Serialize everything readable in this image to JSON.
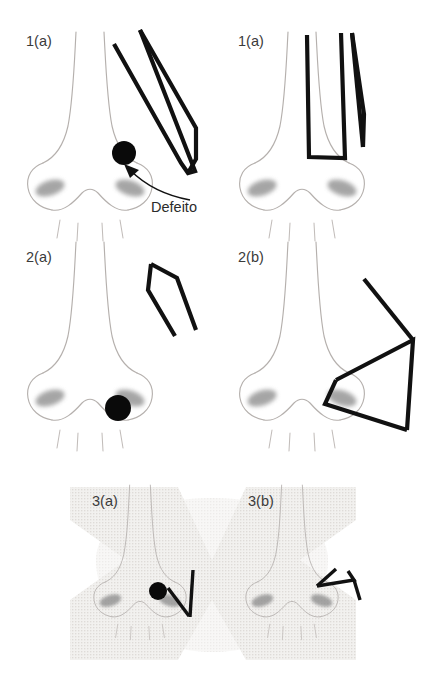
{
  "figure": {
    "language": "pt-BR",
    "canvas": {
      "width": 424,
      "height": 685
    },
    "background_color": "#ffffff",
    "ink_color": "#111111",
    "outline_color": "#b5b0ad",
    "shade_color": "#8d8d8d",
    "texture_color": "#e4e2e0"
  },
  "panels": [
    {
      "id": "panel-1a",
      "label": "1(a)",
      "label_x": 26,
      "label_y": 46,
      "row": 1,
      "column": 1,
      "has_defect_dot": true,
      "has_texture": false,
      "instrument": "elongated-blade-flap"
    },
    {
      "id": "panel-1b",
      "label": "1(a)",
      "label_x": 238,
      "label_y": 46,
      "row": 1,
      "column": 2,
      "has_defect_dot": false,
      "has_texture": false,
      "instrument": "u-shaped-flap"
    },
    {
      "id": "panel-2a",
      "label": "2(a)",
      "label_x": 26,
      "label_y": 262,
      "row": 2,
      "column": 1,
      "has_defect_dot": true,
      "has_texture": false,
      "instrument": "narrow-wedge-flap"
    },
    {
      "id": "panel-2b",
      "label": "2(b)",
      "label_x": 238,
      "label_y": 262,
      "row": 2,
      "column": 2,
      "has_defect_dot": false,
      "has_texture": false,
      "instrument": "double-triangle-flap"
    },
    {
      "id": "panel-3a",
      "label": "3(a)",
      "label_x": 92,
      "label_y": 506,
      "row": 3,
      "column": 1,
      "has_defect_dot": true,
      "has_texture": true,
      "instrument": "short-v-flap"
    },
    {
      "id": "panel-3b",
      "label": "3(b)",
      "label_x": 248,
      "label_y": 506,
      "row": 3,
      "column": 2,
      "has_defect_dot": false,
      "has_texture": true,
      "instrument": "zigzag-closure"
    }
  ],
  "annotations": [
    {
      "id": "defect-callout",
      "text": "Defeito",
      "text_x": 151,
      "text_y": 210,
      "points_to_panel": "panel-1a",
      "arrow_from_x": 148,
      "arrow_from_y": 196,
      "arrow_to_x": 124,
      "arrow_to_y": 166
    }
  ]
}
